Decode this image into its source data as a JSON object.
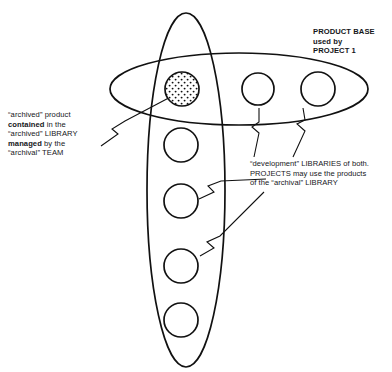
{
  "diagram": {
    "colors": {
      "stroke": "#111111",
      "background": "#ffffff",
      "fill": "#ffffff",
      "stipple": "#111111"
    },
    "shapes": {
      "horizontal_ellipse": {
        "name": "product-base-ellipse",
        "cx": 239,
        "cy": 89,
        "rx": 129,
        "ry": 36
      },
      "vertical_ellipse": {
        "name": "project-library-ellipse",
        "cx": 186,
        "cy": 190,
        "rx": 39,
        "ry": 177
      },
      "circles": [
        {
          "name": "archived-product-circle",
          "cx": 182,
          "cy": 89,
          "r": 17,
          "pattern": "stipple"
        },
        {
          "name": "product-circle-2",
          "cx": 258,
          "cy": 89,
          "r": 16,
          "pattern": "plain"
        },
        {
          "name": "product-circle-3",
          "cx": 318,
          "cy": 89,
          "r": 17,
          "pattern": "plain"
        },
        {
          "name": "library-circle-1",
          "cx": 181,
          "cy": 145,
          "r": 17,
          "pattern": "plain"
        },
        {
          "name": "library-circle-2",
          "cx": 181,
          "cy": 201,
          "r": 17,
          "pattern": "plain"
        },
        {
          "name": "library-circle-3",
          "cx": 181,
          "cy": 266,
          "r": 17,
          "pattern": "plain"
        },
        {
          "name": "library-circle-4",
          "cx": 181,
          "cy": 320,
          "r": 17,
          "pattern": "plain"
        }
      ],
      "connectors": [
        {
          "name": "connector-archived-product",
          "path": "M 101 146 L 118 134 L 112 129 L 125 121 L 180 92"
        },
        {
          "name": "connector-development-left",
          "path": "M 259 108 L 259 122 L 252 127 L 259 133 L 254 157"
        },
        {
          "name": "connector-development-right",
          "path": "M 303 108 L 305 120 L 297 124 L 305 131 L 293 157"
        },
        {
          "name": "connector-library-upper",
          "path": "M 199 199 L 214 192 L 208 186 L 221 181 L 266 179"
        },
        {
          "name": "connector-library-lower",
          "path": "M 200 256 L 214 248 L 207 242 L 220 236 L 264 192"
        }
      ]
    }
  },
  "captions": {
    "product_base": {
      "line1": "PRODUCT BASE",
      "line2": "used by",
      "line3": "PROJECT 1"
    },
    "archived": {
      "line1": "“archived” product",
      "line2_bold": "contained",
      "line2_rest": " in the",
      "line3": "“archived” LIBRARY",
      "line4_bold": "managed",
      "line4_rest": " by the",
      "line5": "“archival” TEAM"
    },
    "development": {
      "line1": "“development” LIBRARIES of both.",
      "line2": "PROJECTS may use the products",
      "line3": "of the “archival” LIBRARY"
    }
  }
}
